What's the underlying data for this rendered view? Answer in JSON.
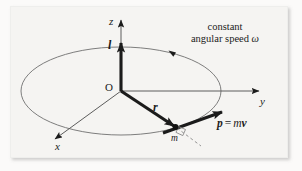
{
  "figure": {
    "kind": "physics-vector-diagram",
    "background_color": "#f5f4f2",
    "ink_color": "#1b1b1b",
    "axes": [
      {
        "id": "z",
        "label": "z",
        "direction": "up"
      },
      {
        "id": "y",
        "label": "y",
        "direction": "right"
      },
      {
        "id": "x",
        "label": "x",
        "direction": "down-left"
      }
    ],
    "origin": {
      "label": "O"
    },
    "vectors": [
      {
        "id": "l",
        "label": "l",
        "description": "angular momentum along z"
      },
      {
        "id": "r",
        "label": "r",
        "description": "position vector from O to m"
      },
      {
        "id": "p",
        "label": "p",
        "description": "linear momentum tangent to circle"
      }
    ],
    "point_masses": [
      {
        "id": "m",
        "label": "m"
      }
    ],
    "momentum_equation": {
      "lhs": "p",
      "equals": "=",
      "mass": "m",
      "velocity": "v"
    },
    "annotation": {
      "line1": "constant",
      "line2_prefix": "angular speed ",
      "line2_symbol": "ω"
    },
    "rotation_marker": {
      "sense": "counterclockwise-as-drawn",
      "on": "circular-orbit"
    },
    "right_angle_marker": {
      "at": "m",
      "between": [
        "r",
        "p"
      ]
    }
  }
}
